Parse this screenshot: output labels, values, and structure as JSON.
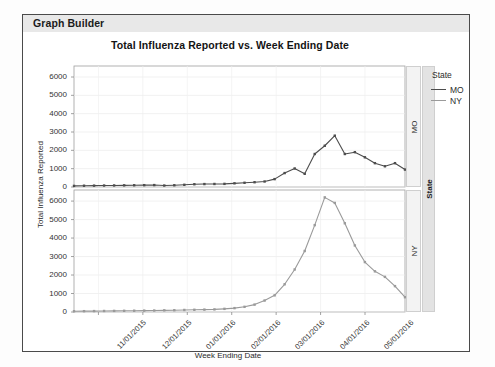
{
  "window": {
    "title": "Graph Builder"
  },
  "chart_data": {
    "type": "line",
    "title": "Total Influenza Reported vs. Week Ending Date",
    "xlabel": "Week Ending Date",
    "ylabel": "Total Influenza Reported",
    "ylim": [
      0,
      6600
    ],
    "yticks": [
      0,
      1000,
      2000,
      3000,
      4000,
      5000,
      6000
    ],
    "ytick_labels": [
      "0",
      "1000",
      "2000",
      "3000",
      "4000",
      "5000",
      "6000"
    ],
    "xticks": [
      "11/01/2015",
      "12/01/2015",
      "01/01/2016",
      "02/01/2016",
      "03/01/2016",
      "05/01/2016"
    ],
    "xtick_labels": [
      "11/01/2015",
      "12/01/2015",
      "01/01/2016",
      "02/01/2016",
      "03/01/2016",
      "04/01/2016",
      "05/01/2016"
    ],
    "grid": true,
    "legend_position": "right",
    "legend_title": "State",
    "facet_variable": "State",
    "facets": [
      "MO",
      "NY"
    ],
    "markers": true,
    "x": [
      "10/10/2015",
      "10/17/2015",
      "10/24/2015",
      "10/31/2015",
      "11/07/2015",
      "11/14/2015",
      "11/21/2015",
      "11/28/2015",
      "12/05/2015",
      "12/12/2015",
      "12/19/2015",
      "12/26/2015",
      "01/02/2016",
      "01/09/2016",
      "01/16/2016",
      "01/23/2016",
      "01/30/2016",
      "02/06/2016",
      "02/13/2016",
      "02/20/2016",
      "02/27/2016",
      "03/05/2016",
      "03/12/2016",
      "03/19/2016",
      "03/26/2016",
      "04/02/2016",
      "04/09/2016",
      "04/16/2016",
      "04/23/2016",
      "04/30/2016",
      "05/07/2016",
      "05/14/2016",
      "05/21/2016",
      "05/28/2016"
    ],
    "series": [
      {
        "name": "MO",
        "color": "#4d4d4d",
        "facet": "MO",
        "values": [
          60,
          70,
          75,
          80,
          85,
          90,
          95,
          100,
          105,
          80,
          95,
          120,
          150,
          160,
          165,
          170,
          200,
          230,
          260,
          300,
          430,
          760,
          1010,
          720,
          1800,
          2250,
          2800,
          1800,
          1900,
          1620,
          1300,
          1130,
          1300,
          950
        ]
      },
      {
        "name": "NY",
        "color": "#9a9a9a",
        "facet": "NY",
        "values": [
          40,
          45,
          50,
          55,
          60,
          65,
          70,
          75,
          80,
          90,
          95,
          110,
          120,
          130,
          140,
          170,
          210,
          280,
          400,
          620,
          900,
          1500,
          2300,
          3300,
          4700,
          6200,
          5900,
          4800,
          3600,
          2700,
          2200,
          1900,
          1400,
          800
        ]
      }
    ]
  },
  "legend": {
    "title": "State",
    "items": [
      {
        "label": "MO",
        "color": "#4d4d4d"
      },
      {
        "label": "NY",
        "color": "#9a9a9a"
      }
    ]
  },
  "facet_strips": {
    "group_label": "State",
    "top": "MO",
    "bottom": "NY"
  }
}
